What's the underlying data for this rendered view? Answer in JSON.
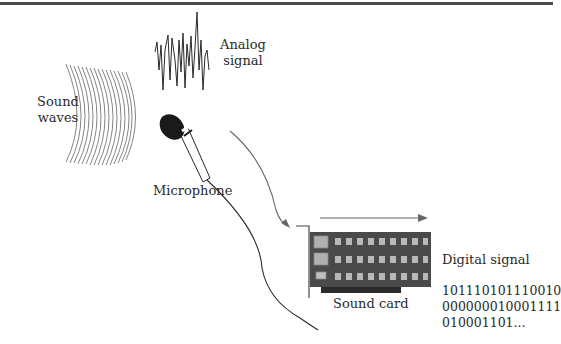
{
  "labels": {
    "sound_waves_line1": "Sound",
    "sound_waves_line2": "waves",
    "analog_signal_line1": "Analog",
    "analog_signal_line2": "signal",
    "microphone": "Microphone",
    "sound_card": "Sound card",
    "digital_signal": "Digital signal"
  },
  "binary_data": {
    "lines": [
      "101110101110010",
      "000000010001111",
      "010001101..."
    ]
  },
  "colors": {
    "line": "#2a2a2a",
    "arrow": "#666666",
    "card_body": "#4a4a4a",
    "chip": "#b0b0b0",
    "top_rule": "#4a4a4a"
  }
}
